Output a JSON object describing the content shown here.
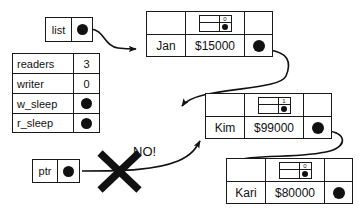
{
  "diagram": {
    "pointers": [
      {
        "name": "list",
        "target": "Jan"
      },
      {
        "name": "ptr",
        "target": "Kim"
      }
    ],
    "status_table": {
      "rows": [
        {
          "key": "readers",
          "value": "3"
        },
        {
          "key": "writer",
          "value": "0"
        },
        {
          "key": "w_sleep",
          "value": "",
          "is_pointer": true
        },
        {
          "key": "r_sleep",
          "value": "",
          "is_pointer": true
        }
      ]
    },
    "nodes": [
      {
        "name": "Jan",
        "amount": "$15000",
        "lock_count": "0",
        "has_next": true
      },
      {
        "name": "Kim",
        "amount": "$99000",
        "lock_count": "1",
        "has_next": true
      },
      {
        "name": "Kari",
        "amount": "$80000",
        "lock_count": "0",
        "has_next": false
      }
    ],
    "annotation": {
      "label": "NO!",
      "mark": "x-cross-mark"
    },
    "colors": {
      "stroke": "#1a1a1a",
      "fill": "#111111",
      "background": "#ffffff"
    }
  }
}
